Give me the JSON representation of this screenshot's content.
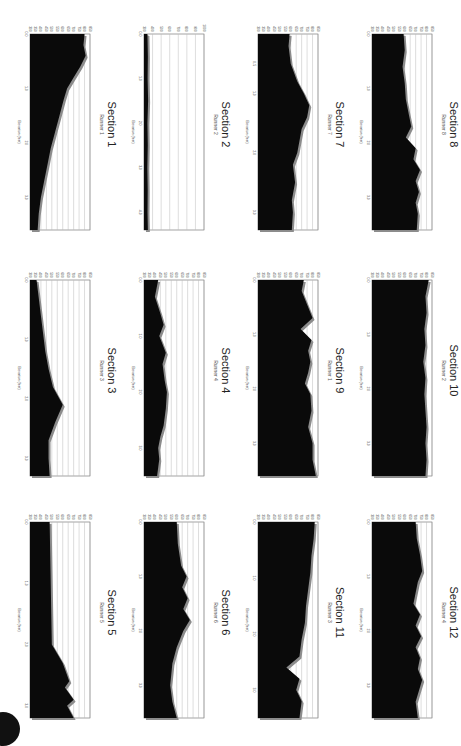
{
  "page": {
    "layout": "4 columns x 3 rows, charts rotated 90 degrees"
  },
  "colors": {
    "fill": "#0a0a0a",
    "edge": "#8c8c8c",
    "grid": "#bbbbbb",
    "axis": "#666666"
  },
  "chart_data": [
    {
      "type": "area",
      "title": "Section 1",
      "subtitle": "Runner 1",
      "xlabel": "",
      "ylabel": "Elevation (feet)",
      "ylim": [
        300,
        850
      ],
      "yticks": [
        300,
        350,
        400,
        450,
        500,
        550,
        600,
        650,
        700,
        750,
        800,
        850
      ],
      "xticks": [
        "0.0",
        "1.0",
        "2.0",
        "3.0"
      ],
      "x": [
        0,
        0.2,
        0.4,
        0.6,
        0.8,
        1.0,
        1.2,
        1.5,
        1.8,
        2.1,
        2.4,
        2.7,
        3.0,
        3.3,
        3.6
      ],
      "values": [
        800,
        790,
        810,
        760,
        700,
        640,
        610,
        570,
        530,
        490,
        460,
        430,
        400,
        380,
        370
      ]
    },
    {
      "type": "area",
      "title": "Section 2",
      "subtitle": "Runner 2",
      "xlabel": "",
      "ylabel": "Elevation (feet)",
      "ylim": [
        300,
        1000
      ],
      "yticks": [
        300,
        400,
        500,
        600,
        700,
        800,
        900,
        1000
      ],
      "xticks": [
        "0.0",
        "1.0",
        "2.0",
        "3.0",
        "4.0"
      ],
      "x": [
        0,
        0.5,
        1.0,
        1.5,
        2.0,
        2.5,
        3.0,
        3.5,
        4.0,
        4.4
      ],
      "values": [
        340,
        345,
        342,
        348,
        340,
        344,
        339,
        343,
        341,
        345
      ]
    },
    {
      "type": "area",
      "title": "Section 3",
      "subtitle": "Runner 3",
      "xlabel": "",
      "ylabel": "Elevation (feet)",
      "ylim": [
        300,
        850
      ],
      "yticks": [
        300,
        350,
        400,
        450,
        500,
        550,
        600,
        650,
        700,
        750,
        800,
        850
      ],
      "xticks": [
        "0.0",
        "1.0",
        "2.0",
        "3.0"
      ],
      "x": [
        0,
        0.3,
        0.6,
        0.9,
        1.2,
        1.5,
        1.8,
        2.1,
        2.4,
        2.7,
        3.0,
        3.3
      ],
      "values": [
        360,
        380,
        400,
        420,
        440,
        470,
        510,
        600,
        530,
        470,
        470,
        480
      ]
    },
    {
      "type": "area",
      "title": "Section 4",
      "subtitle": "Runner 4",
      "xlabel": "",
      "ylabel": "Elevation (feet)",
      "ylim": [
        300,
        850
      ],
      "yticks": [
        300,
        350,
        400,
        450,
        500,
        550,
        600,
        650,
        700,
        750,
        800,
        850
      ],
      "xticks": [
        "0.0",
        "1.0",
        "2.0",
        "3.0"
      ],
      "x": [
        0,
        0.3,
        0.6,
        0.8,
        1.0,
        1.3,
        1.5,
        1.8,
        2.0,
        2.3,
        2.6,
        2.8,
        3.0,
        3.2,
        3.5
      ],
      "values": [
        430,
        400,
        450,
        480,
        440,
        500,
        470,
        490,
        510,
        500,
        480,
        450,
        430,
        440,
        420
      ]
    },
    {
      "type": "area",
      "title": "Section 5",
      "subtitle": "Runner 5",
      "xlabel": "",
      "ylabel": "Elevation (feet)",
      "ylim": [
        300,
        850
      ],
      "yticks": [
        300,
        350,
        400,
        450,
        500,
        550,
        600,
        650,
        700,
        750,
        800,
        850
      ],
      "xticks": [
        "0.0",
        "1.0",
        "2.0",
        "3.0"
      ],
      "x": [
        0,
        0.5,
        1.0,
        1.5,
        2.0,
        2.3,
        2.6,
        2.7,
        2.9,
        3.0,
        3.2
      ],
      "values": [
        480,
        485,
        490,
        495,
        500,
        600,
        660,
        620,
        700,
        640,
        700
      ]
    },
    {
      "type": "area",
      "title": "Section 6",
      "subtitle": "Runner 6",
      "xlabel": "",
      "ylabel": "Elevation (feet)",
      "ylim": [
        300,
        850
      ],
      "yticks": [
        300,
        350,
        400,
        450,
        500,
        550,
        600,
        650,
        700,
        750,
        800,
        850
      ],
      "xticks": [
        "0.0",
        "1.0",
        "2.0",
        "3.0"
      ],
      "x": [
        0,
        0.4,
        0.8,
        1.0,
        1.2,
        1.4,
        1.6,
        1.8,
        2.0,
        2.3,
        2.6,
        3.0,
        3.3,
        3.6
      ],
      "values": [
        600,
        610,
        640,
        690,
        650,
        700,
        660,
        720,
        660,
        600,
        560,
        540,
        560,
        600
      ]
    },
    {
      "type": "area",
      "title": "Section 7",
      "subtitle": "Runner 7",
      "xlabel": "",
      "ylabel": "Elevation (feet)",
      "ylim": [
        300,
        850
      ],
      "yticks": [
        300,
        350,
        400,
        450,
        500,
        550,
        600,
        650,
        700,
        750,
        800,
        850
      ],
      "xticks": [
        "0.5",
        "1.0",
        "2.0",
        "3.0"
      ],
      "x": [
        0,
        0.2,
        0.5,
        0.8,
        1.0,
        1.2,
        1.4,
        1.6,
        1.8,
        2.0,
        2.2,
        2.5,
        2.8,
        3.0,
        3.3
      ],
      "values": [
        590,
        580,
        600,
        660,
        720,
        770,
        750,
        700,
        680,
        660,
        620,
        640,
        610,
        620,
        610
      ]
    },
    {
      "type": "area",
      "title": "Section 8",
      "subtitle": "Runner 8",
      "xlabel": "",
      "ylabel": "Elevation (feet)",
      "ylim": [
        300,
        850
      ],
      "yticks": [
        300,
        350,
        400,
        450,
        500,
        550,
        600,
        650,
        700,
        750,
        800,
        850
      ],
      "xticks": [
        "0.0",
        "1.0",
        "2.0",
        "3.0"
      ],
      "x": [
        0,
        0.3,
        0.6,
        0.9,
        1.2,
        1.5,
        1.7,
        1.9,
        2.1,
        2.3,
        2.5,
        2.7,
        2.9,
        3.1,
        3.3,
        3.6
      ],
      "values": [
        590,
        600,
        580,
        600,
        610,
        640,
        660,
        610,
        700,
        680,
        740,
        700,
        730,
        700,
        720,
        710
      ]
    },
    {
      "type": "area",
      "title": "Section 9",
      "subtitle": "Runner 1",
      "xlabel": "",
      "ylabel": "Elevation (feet)",
      "ylim": [
        300,
        850
      ],
      "yticks": [
        300,
        350,
        400,
        450,
        500,
        550,
        600,
        650,
        700,
        750,
        800,
        850
      ],
      "xticks": [
        "0.0",
        "1.0",
        "2.0",
        "3.0"
      ],
      "x": [
        0,
        0.2,
        0.5,
        0.7,
        0.9,
        1.1,
        1.3,
        1.5,
        1.7,
        1.9,
        2.1,
        2.4,
        2.7,
        3.0,
        3.3,
        3.6
      ],
      "values": [
        720,
        700,
        760,
        800,
        690,
        790,
        760,
        780,
        760,
        730,
        780,
        790,
        760,
        800,
        800,
        830
      ]
    },
    {
      "type": "area",
      "title": "Section 10",
      "subtitle": "Runner 2",
      "xlabel": "",
      "ylabel": "Elevation (feet)",
      "ylim": [
        300,
        850
      ],
      "yticks": [
        300,
        350,
        400,
        450,
        500,
        550,
        600,
        650,
        700,
        750,
        800,
        850
      ],
      "xticks": [
        "0.0",
        "1.0",
        "2.0",
        "3.0"
      ],
      "x": [
        0,
        0.3,
        0.6,
        0.9,
        1.2,
        1.5,
        1.8,
        2.1,
        2.4,
        2.7,
        3.0,
        3.3,
        3.6
      ],
      "values": [
        820,
        790,
        800,
        780,
        790,
        770,
        790,
        780,
        790,
        800,
        790,
        800,
        790
      ]
    },
    {
      "type": "area",
      "title": "Section 11",
      "subtitle": "Runner 3",
      "xlabel": "",
      "ylabel": "Elevation (feet)",
      "ylim": [
        300,
        850
      ],
      "yticks": [
        300,
        350,
        400,
        450,
        500,
        550,
        600,
        650,
        700,
        750,
        800,
        850
      ],
      "xticks": [
        "0.0",
        "1.0",
        "2.0",
        "3.0"
      ],
      "x": [
        0,
        0.3,
        0.6,
        0.9,
        1.2,
        1.5,
        1.8,
        2.1,
        2.4,
        2.6,
        2.8,
        3.0,
        3.2,
        3.5
      ],
      "values": [
        820,
        810,
        790,
        780,
        760,
        740,
        730,
        700,
        680,
        560,
        680,
        650,
        700,
        680
      ]
    },
    {
      "type": "area",
      "title": "Section 12",
      "subtitle": "Runner 4",
      "xlabel": "",
      "ylabel": "Elevation (feet)",
      "ylim": [
        300,
        850
      ],
      "yticks": [
        300,
        350,
        400,
        450,
        500,
        550,
        600,
        650,
        700,
        750,
        800,
        850
      ],
      "xticks": [
        "0.0",
        "1.0",
        "2.0",
        "3.0"
      ],
      "x": [
        0,
        0.3,
        0.6,
        0.9,
        1.1,
        1.3,
        1.5,
        1.7,
        1.9,
        2.1,
        2.3,
        2.5,
        2.7,
        2.9,
        3.1,
        3.3,
        3.6
      ],
      "values": [
        700,
        710,
        740,
        760,
        720,
        700,
        680,
        740,
        700,
        750,
        700,
        740,
        720,
        760,
        730,
        700,
        720
      ]
    }
  ]
}
